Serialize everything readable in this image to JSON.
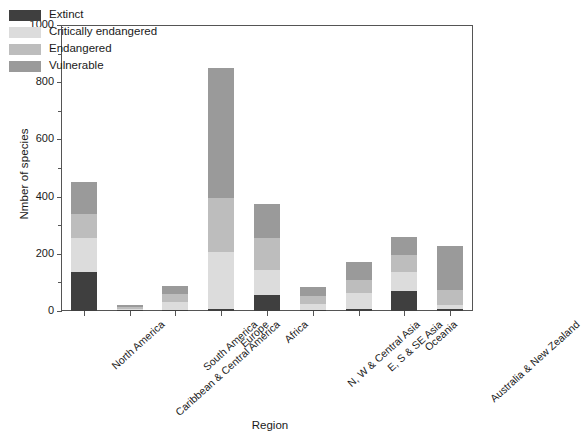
{
  "chart_data": {
    "type": "bar",
    "stacked": true,
    "title": "",
    "xlabel": "Region",
    "ylabel": "Nmber of species",
    "ylim": [
      0,
      1000
    ],
    "yticks": [
      0,
      200,
      400,
      600,
      800,
      1000
    ],
    "yticks_minor": [
      100,
      300,
      500,
      700,
      900
    ],
    "grid": false,
    "legend_position": "top-left",
    "categories": [
      "North America",
      "Caribbean & Central America",
      "South America",
      "Europe",
      "Africa",
      "N, W & Central Asia",
      "E, S & SE Asia",
      "Oceania",
      "Australia & New Zealand"
    ],
    "series": [
      {
        "name": "Extinct",
        "color": "#3f3f3f",
        "values": [
          135,
          3,
          4,
          8,
          55,
          2,
          6,
          70,
          7
        ]
      },
      {
        "name": "Critically endangered",
        "color": "#dcdcdc",
        "values": [
          120,
          5,
          26,
          197,
          90,
          24,
          57,
          68,
          13
        ]
      },
      {
        "name": "Endangered",
        "color": "#bdbdbd",
        "values": [
          85,
          6,
          28,
          190,
          110,
          26,
          45,
          57,
          55
        ]
      },
      {
        "name": "Vulnerable",
        "color": "#9a9a9a",
        "values": [
          110,
          8,
          30,
          455,
          120,
          33,
          62,
          65,
          153
        ]
      }
    ],
    "totals": [
      450,
      22,
      88,
      850,
      375,
      85,
      170,
      260,
      228
    ]
  },
  "legend": {
    "items": [
      {
        "label": "Extinct"
      },
      {
        "label": "Critically endangered"
      },
      {
        "label": "Endangered"
      },
      {
        "label": "Vulnerable"
      }
    ]
  }
}
